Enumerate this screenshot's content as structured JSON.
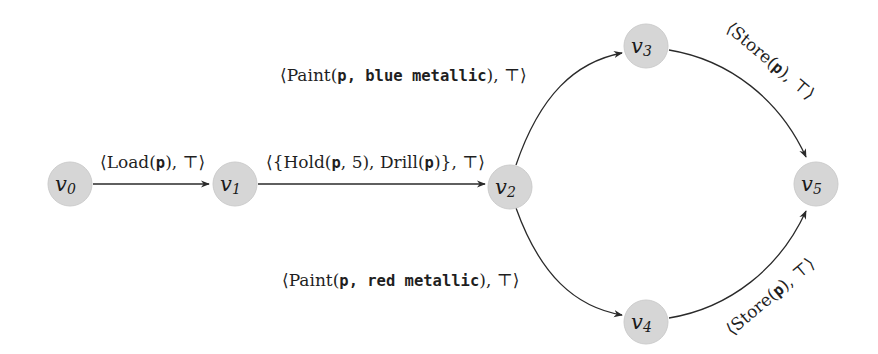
{
  "diagram": {
    "type": "state-transition-graph",
    "node_fill": "#d6d6d6",
    "edge_color": "#2a2a2a",
    "nodes": [
      {
        "id": "v0",
        "base": "v",
        "sub": "0"
      },
      {
        "id": "v1",
        "base": "v",
        "sub": "1"
      },
      {
        "id": "v2",
        "base": "v",
        "sub": "2"
      },
      {
        "id": "v3",
        "base": "v",
        "sub": "3"
      },
      {
        "id": "v4",
        "base": "v",
        "sub": "4"
      },
      {
        "id": "v5",
        "base": "v",
        "sub": "5"
      }
    ],
    "edges": [
      {
        "from": "v0",
        "to": "v1",
        "label": "⟨Load(p), ⊤⟩",
        "parts": {
          "open": "⟨Load(",
          "arg": "p",
          "close": "), ⊤⟩"
        }
      },
      {
        "from": "v1",
        "to": "v2",
        "label": "⟨{Hold(p, 5), Drill(p)}, ⊤⟩",
        "parts": {
          "p1": "⟨{Hold(",
          "a1": "p",
          "p2": ", ",
          "a2": "5",
          "p3": "), Drill(",
          "a3": "p",
          "p4": ")}, ⊤⟩"
        }
      },
      {
        "from": "v2",
        "to": "v3",
        "label": "⟨Paint(p, blue metallic), ⊤⟩",
        "parts": {
          "open": "⟨Paint(",
          "arg": "p, blue metallic",
          "close": "), ⊤⟩"
        }
      },
      {
        "from": "v2",
        "to": "v4",
        "label": "⟨Paint(p, red metallic), ⊤⟩",
        "parts": {
          "open": "⟨Paint(",
          "arg": "p, red metallic",
          "close": "), ⊤⟩"
        }
      },
      {
        "from": "v3",
        "to": "v5",
        "label": "⟨Store(p), ⊤⟩",
        "parts": {
          "open": "⟨Store(",
          "arg": "p",
          "close": "), ⊤⟩"
        }
      },
      {
        "from": "v4",
        "to": "v5",
        "label": "⟨Store(p), ⊤⟩",
        "parts": {
          "open": "⟨Store(",
          "arg": "p",
          "close": "), ⊤⟩"
        }
      }
    ]
  }
}
